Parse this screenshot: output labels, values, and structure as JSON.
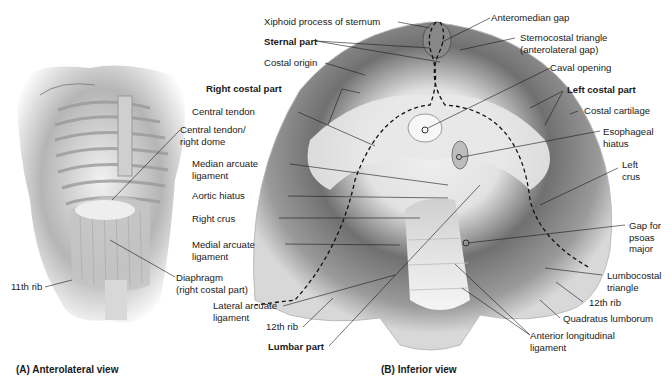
{
  "figure": {
    "panel_a": {
      "caption": "(A) Anterolateral view",
      "labels": {
        "central_tendon_right_dome_1": "Central tendon/",
        "central_tendon_right_dome_2": "right dome",
        "diaphragm_1": "Diaphragm",
        "diaphragm_2": "(right costal part)",
        "eleventh_rib": "11th rib"
      }
    },
    "panel_b": {
      "caption": "(B) Inferior view",
      "labels": {
        "xiphoid": "Xiphoid process of sternum",
        "sternal_part": "Sternal part",
        "costal_origin": "Costal origin",
        "right_costal_part": "Right costal part",
        "central_tendon": "Central tendon",
        "median_arcuate_1": "Median arcuate",
        "median_arcuate_2": "ligament",
        "aortic_hiatus": "Aortic hiatus",
        "right_crus": "Right crus",
        "medial_arcuate_1": "Medial arcuate",
        "medial_arcuate_2": "ligament",
        "lateral_arcuate_1": "Lateral arcuate",
        "lateral_arcuate_2": "ligament",
        "twelfth_rib_left": "12th rib",
        "lumbar_part": "Lumbar part",
        "anteromedian_gap": "Anteromedian gap",
        "sternocostal_1": "Sternocostal triangle",
        "sternocostal_2": "(anterolateral gap)",
        "caval_opening": "Caval opening",
        "left_costal_part": "Left costal part",
        "costal_cartilage": "Costal cartilage",
        "esophageal_1": "Esophageal",
        "esophageal_2": "hiatus",
        "left_crus_1": "Left",
        "left_crus_2": "crus",
        "psoas_1": "Gap for",
        "psoas_2": "psoas",
        "psoas_3": "major",
        "lumbocostal_1": "Lumbocostal",
        "lumbocostal_2": "triangle",
        "twelfth_rib_right": "12th rib",
        "quadratus": "Quadratus lumborum",
        "anterior_long_1": "Anterior longitudinal",
        "anterior_long_2": "ligament"
      }
    },
    "colors": {
      "ink": "#1a1a1a",
      "muscle_dark": "#5a5a5a",
      "muscle_mid": "#8a8a8a",
      "tendon_light": "#e6e6e6",
      "background": "#ffffff"
    }
  }
}
